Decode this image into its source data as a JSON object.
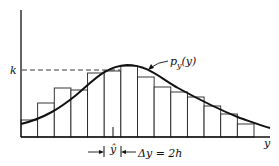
{
  "chart_data": {
    "type": "bar",
    "title": "",
    "xlabel": "y",
    "ylabel": "",
    "categories": [
      "1",
      "2",
      "3",
      "4",
      "5",
      "6",
      "7",
      "8",
      "9",
      "10",
      "11",
      "12",
      "13",
      "14"
    ],
    "values": [
      17,
      34,
      49,
      47,
      64,
      66,
      71,
      60,
      50,
      45,
      40,
      31,
      23,
      13
    ],
    "ylim": [
      0,
      100
    ],
    "grid": false,
    "legend": null,
    "series": [
      {
        "name": "histogram",
        "type": "bar",
        "values": [
          17,
          34,
          49,
          47,
          64,
          66,
          71,
          60,
          50,
          45,
          40,
          31,
          23,
          13
        ]
      },
      {
        "name": "p_y(y)",
        "type": "line",
        "description": "smooth density curve over histogram, peak near bar 7"
      }
    ],
    "annotations": [
      {
        "text": "k",
        "description": "dashed horizontal line at peak density level",
        "value": 67
      },
      {
        "text": "p_y(y)",
        "description": "curve label with arrow"
      },
      {
        "text": "ŷ",
        "description": "tick mark under histogram marking mode estimate"
      },
      {
        "text": "Δy = 2h",
        "description": "bin width indicator with arrows"
      }
    ]
  },
  "labels": {
    "k": "k",
    "curve": "p",
    "curve_sub": "y",
    "curve_arg": "(y)",
    "x_axis": "y",
    "yhat": "ŷ",
    "delta": "Δy = 2h"
  }
}
